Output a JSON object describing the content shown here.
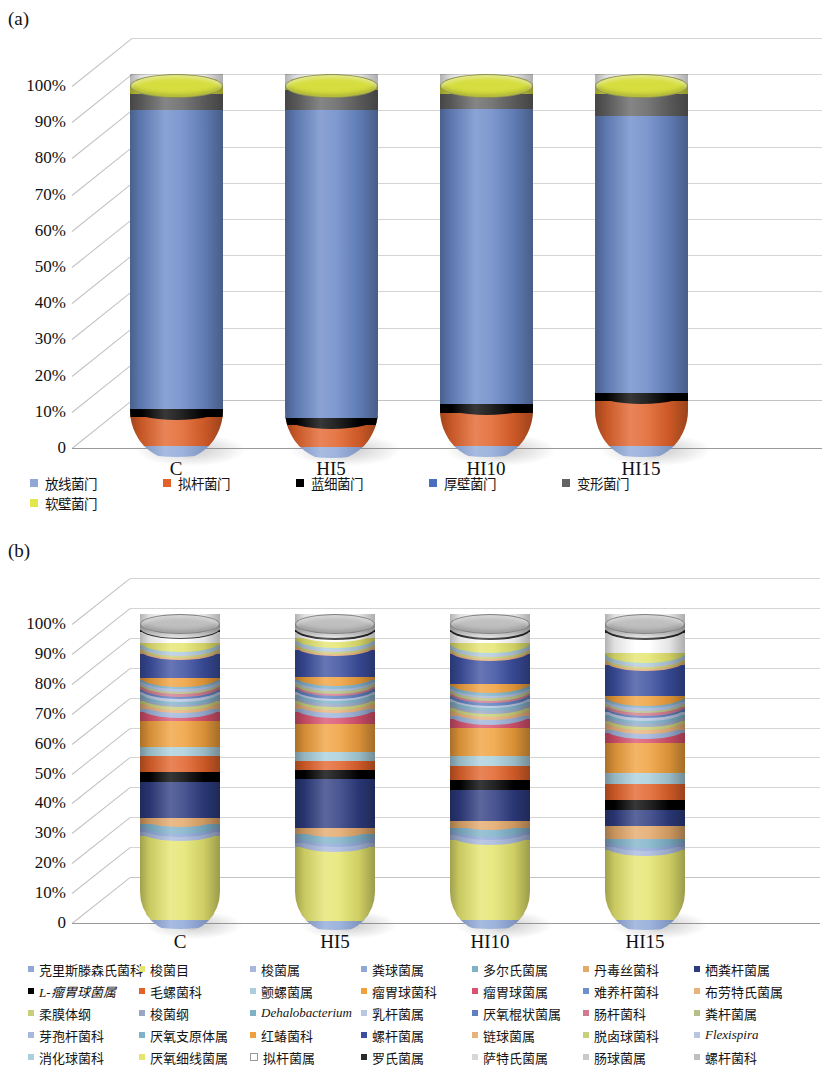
{
  "panels": [
    {
      "tag": "(a)"
    },
    {
      "tag": "(b)"
    }
  ],
  "axis": {
    "yticks": [
      "100%",
      "90%",
      "80%",
      "70%",
      "60%",
      "50%",
      "40%",
      "30%",
      "20%",
      "10%",
      "0"
    ],
    "xticks": [
      "C",
      "HI5",
      "HI10",
      "HI15"
    ]
  },
  "chart_data": [
    {
      "type": "bar",
      "stacked": true,
      "percent": true,
      "title": "(a) Relative abundance at phylum level",
      "xlabel": "",
      "ylabel": "",
      "ylim": [
        0,
        100
      ],
      "grid": true,
      "legend_position": "bottom",
      "categories": [
        "C",
        "HI5",
        "HI10",
        "HI15"
      ],
      "series": [
        {
          "name": "放线菌门",
          "color": "#8fa8d8",
          "values": [
            0.8,
            0.6,
            0.8,
            0.7
          ]
        },
        {
          "name": "拟杆菌门",
          "color": "#e2622a",
          "values": [
            8.0,
            6.0,
            9.0,
            12.5
          ]
        },
        {
          "name": "蓝细菌门",
          "color": "#000000",
          "values": [
            2.2,
            2.0,
            2.6,
            2.3
          ]
        },
        {
          "name": "厚壁菌门",
          "color": "#6a89c8",
          "values": [
            82.5,
            85.0,
            81.5,
            76.5
          ]
        },
        {
          "name": "变形菌门",
          "color": "#636363",
          "values": [
            4.5,
            5.4,
            4.1,
            6.0
          ]
        },
        {
          "name": "软壁菌门",
          "color": "#d6de3f",
          "values": [
            2.0,
            1.0,
            2.0,
            2.0
          ]
        }
      ]
    },
    {
      "type": "bar",
      "stacked": true,
      "percent": true,
      "title": "(b) Relative abundance at genus level",
      "xlabel": "",
      "ylabel": "",
      "ylim": [
        0,
        100
      ],
      "grid": true,
      "legend_position": "bottom",
      "categories": [
        "C",
        "HI5",
        "HI10",
        "HI15"
      ],
      "series": [
        {
          "name": "克里斯滕森氏菌科",
          "color": "#8fa8d8",
          "values": [
            1.2,
            1.0,
            1.2,
            1.1
          ]
        },
        {
          "name": "梭菌目",
          "color": "#e5e56f",
          "values": [
            28.0,
            24.0,
            26.0,
            22.0
          ]
        },
        {
          "name": "梭菌属",
          "color": "#a8b8dd",
          "values": [
            1.2,
            1.4,
            1.3,
            1.2
          ]
        },
        {
          "name": "粪球菌属",
          "color": "#8fa8d8",
          "values": [
            1.6,
            1.8,
            1.5,
            1.4
          ]
        },
        {
          "name": "多尔氏菌属",
          "color": "#7fb2c9",
          "values": [
            1.0,
            1.0,
            1.0,
            1.0
          ]
        },
        {
          "name": "丹毒丝菌科",
          "color": "#e3a86a",
          "values": [
            2.2,
            2.0,
            2.2,
            4.0
          ]
        },
        {
          "name": "栖粪杆菌属",
          "color": "#2d3c80",
          "values": [
            12.0,
            16.0,
            10.0,
            5.0
          ]
        },
        {
          "name": "L-瘤胃球菌属",
          "color": "#000000",
          "values": [
            3.2,
            3.0,
            3.2,
            3.4
          ]
        },
        {
          "name": "毛螺菌科",
          "color": "#e2622a",
          "values": [
            5.2,
            3.0,
            4.5,
            5.0
          ]
        },
        {
          "name": "颤螺菌属",
          "color": "#a9cfdc",
          "values": [
            3.2,
            3.0,
            3.2,
            3.4
          ]
        },
        {
          "name": "瘤胃球菌科",
          "color": "#f0a03c",
          "values": [
            8.5,
            9.0,
            9.0,
            9.5
          ]
        },
        {
          "name": "瘤胃球菌属",
          "color": "#d9526f",
          "values": [
            3.0,
            4.0,
            3.0,
            3.0
          ]
        },
        {
          "name": "难养杆菌科",
          "color": "#9fb4da",
          "values": [
            1.0,
            1.0,
            1.0,
            1.0
          ]
        },
        {
          "name": "布劳特氏菌属",
          "color": "#e8b27c",
          "values": [
            1.6,
            1.6,
            1.6,
            1.8
          ]
        },
        {
          "name": "柔膜体纲",
          "color": "#c8cf7a",
          "values": [
            1.0,
            0.9,
            1.0,
            1.0
          ]
        },
        {
          "name": "梭菌纲",
          "color": "#9aa7c4",
          "values": [
            1.0,
            1.0,
            1.0,
            1.0
          ]
        },
        {
          "name": "Dehalobacterium",
          "color": "#7fb2c9",
          "values": [
            0.9,
            0.9,
            0.9,
            0.9
          ]
        },
        {
          "name": "乳杆菌属",
          "color": "#b9c6e0",
          "values": [
            1.0,
            1.0,
            1.0,
            1.0
          ]
        },
        {
          "name": "厌氧棍状菌属",
          "color": "#5f7fc0",
          "values": [
            0.9,
            0.9,
            0.9,
            0.9
          ]
        },
        {
          "name": "肠杆菌科",
          "color": "#d07b8e",
          "values": [
            0.8,
            0.8,
            0.8,
            0.8
          ]
        },
        {
          "name": "粪杆菌属",
          "color": "#b6bf86",
          "values": [
            0.8,
            0.8,
            0.8,
            0.8
          ]
        },
        {
          "name": "芽孢杆菌科",
          "color": "#a8b8dd",
          "values": [
            0.8,
            0.8,
            0.8,
            0.8
          ]
        },
        {
          "name": "厌氧支原体属",
          "color": "#7fb2c9",
          "values": [
            0.8,
            0.8,
            0.8,
            0.8
          ]
        },
        {
          "name": "红蝽菌科",
          "color": "#f0a03c",
          "values": [
            0.8,
            0.8,
            0.8,
            0.8
          ]
        },
        {
          "name": "螺杆菌属",
          "color": "#3b4fa0",
          "values": [
            8.0,
            9.0,
            9.5,
            10.0
          ]
        },
        {
          "name": "链球菌属",
          "color": "#e8b27c",
          "values": [
            0.8,
            0.8,
            0.8,
            0.8
          ]
        },
        {
          "name": "脱卤球菌科",
          "color": "#c8cf7a",
          "values": [
            0.7,
            0.7,
            0.7,
            0.7
          ]
        },
        {
          "name": "Flexispira",
          "color": "#b9c6e0",
          "values": [
            0.7,
            0.7,
            0.7,
            0.7
          ]
        },
        {
          "name": "消化球菌科",
          "color": "#a9cfdc",
          "values": [
            0.7,
            0.7,
            0.7,
            0.7
          ]
        },
        {
          "name": "厌氧细线菌属",
          "color": "#e5e56f",
          "values": [
            0.7,
            0.7,
            0.7,
            0.7
          ]
        },
        {
          "name": "拟杆菌属",
          "color": "#ffffff",
          "values": [
            3.5,
            2.0,
            3.5,
            6.5
          ]
        },
        {
          "name": "罗氏菌属",
          "color": "#2b2b2b",
          "values": [
            0.7,
            0.7,
            0.7,
            0.7
          ]
        },
        {
          "name": "萨特氏菌属",
          "color": "#d7d7d7",
          "values": [
            0.6,
            0.6,
            0.6,
            0.6
          ]
        },
        {
          "name": "肠球菌属",
          "color": "#c9c9c9",
          "values": [
            0.6,
            0.6,
            0.6,
            0.6
          ]
        },
        {
          "name": "螺杆菌科",
          "color": "#bfbfbf",
          "values": [
            0.6,
            0.6,
            0.6,
            0.6
          ]
        }
      ]
    }
  ],
  "legend_a": [
    {
      "label": "放线菌门",
      "color": "#8fa8d8"
    },
    {
      "label": "拟杆菌门",
      "color": "#e2622a"
    },
    {
      "label": "蓝细菌门",
      "color": "#000000"
    },
    {
      "label": "厚壁菌门",
      "color": "#4a6fbf"
    },
    {
      "label": "变形菌门",
      "color": "#636363"
    },
    {
      "label": "软壁菌门",
      "color": "#e3e84a"
    }
  ],
  "legend_b": [
    {
      "label": "克里斯滕森氏菌科",
      "color": "#8fa8d8",
      "italic": false
    },
    {
      "label": "梭菌目",
      "color": "#e5e56f",
      "italic": false
    },
    {
      "label": "梭菌属",
      "color": "#a8b8dd",
      "italic": false
    },
    {
      "label": "粪球菌属",
      "color": "#8fa8d8",
      "italic": false
    },
    {
      "label": "多尔氏菌属",
      "color": "#7fb2c9",
      "italic": false
    },
    {
      "label": "丹毒丝菌科",
      "color": "#e3a86a",
      "italic": false
    },
    {
      "label": "栖粪杆菌属",
      "color": "#2d3c80",
      "italic": false
    },
    {
      "label": "L-瘤胃球菌属",
      "color": "#000000",
      "italic": true
    },
    {
      "label": "毛螺菌科",
      "color": "#e2622a",
      "italic": false
    },
    {
      "label": "颤螺菌属",
      "color": "#a9cfdc",
      "italic": false
    },
    {
      "label": "瘤胃球菌科",
      "color": "#f0a03c",
      "italic": false
    },
    {
      "label": "瘤胃球菌属",
      "color": "#d9526f",
      "italic": false
    },
    {
      "label": "难养杆菌科",
      "color": "#6f8fd0",
      "italic": false
    },
    {
      "label": "布劳特氏菌属",
      "color": "#e8b27c",
      "italic": false
    },
    {
      "label": "柔膜体纲",
      "color": "#c8cf7a",
      "italic": false
    },
    {
      "label": "梭菌纲",
      "color": "#9aa7c4",
      "italic": false
    },
    {
      "label": "Dehalobacterium",
      "color": "#7fb2c9",
      "italic": true
    },
    {
      "label": "乳杆菌属",
      "color": "#b9c6e0",
      "italic": false
    },
    {
      "label": "厌氧棍状菌属",
      "color": "#5f7fc0",
      "italic": false
    },
    {
      "label": "肠杆菌科",
      "color": "#d07b8e",
      "italic": false
    },
    {
      "label": "粪杆菌属",
      "color": "#b6bf86",
      "italic": false
    },
    {
      "label": "芽孢杆菌科",
      "color": "#a8b8dd",
      "italic": false
    },
    {
      "label": "厌氧支原体属",
      "color": "#7fb2c9",
      "italic": false
    },
    {
      "label": "红蝽菌科",
      "color": "#f0a03c",
      "italic": false
    },
    {
      "label": "螺杆菌属",
      "color": "#3b4fa0",
      "italic": false
    },
    {
      "label": "链球菌属",
      "color": "#e8b27c",
      "italic": false
    },
    {
      "label": "脱卤球菌科",
      "color": "#c8cf7a",
      "italic": false
    },
    {
      "label": "Flexispira",
      "color": "#b9c6e0",
      "italic": true
    },
    {
      "label": "消化球菌科",
      "color": "#a9cfdc",
      "italic": false
    },
    {
      "label": "厌氧细线菌属",
      "color": "#e5e56f",
      "italic": false
    },
    {
      "label": "拟杆菌属",
      "color": "#ffffff",
      "italic": false
    },
    {
      "label": "罗氏菌属",
      "color": "#2b2b2b",
      "italic": false
    },
    {
      "label": "萨特氏菌属",
      "color": "#d7d7d7",
      "italic": false
    },
    {
      "label": "肠球菌属",
      "color": "#c9c9c9",
      "italic": false
    },
    {
      "label": "螺杆菌科",
      "color": "#bfbfbf",
      "italic": false
    }
  ]
}
